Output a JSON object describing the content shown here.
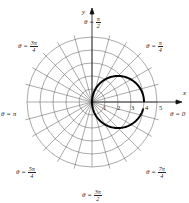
{
  "diagram": {
    "type": "polar-graph",
    "center": {
      "x": 92,
      "y": 102
    },
    "unit_px": 13,
    "rings": [
      1,
      2,
      3,
      4,
      5
    ],
    "radial_step_deg": 15,
    "axes": {
      "x_label": "x",
      "y_label": "y"
    },
    "r_tick_labels": [
      "1",
      "2",
      "3",
      "4",
      "5"
    ],
    "curve": {
      "description": "circle through origin, r = 4cos θ, with small gap just below the positive x-axis",
      "color": "#000000",
      "diameter": 4
    }
  },
  "angle_labels": [
    {
      "id": "pi_over_2",
      "prefix": "θ = ",
      "num": "π",
      "den": "2"
    },
    {
      "id": "pi_over_4",
      "prefix": "θ = ",
      "num": "π",
      "den": "4"
    },
    {
      "id": "three_pi_over_4",
      "prefix": "θ = ",
      "num": "3π",
      "den": "4"
    },
    {
      "id": "pi",
      "text": "θ = π"
    },
    {
      "id": "zero",
      "text": "θ = 0"
    },
    {
      "id": "five_pi_over_4",
      "prefix": "θ = ",
      "num": "5π",
      "den": "4"
    },
    {
      "id": "seven_pi_over_4",
      "prefix": "θ = ",
      "num": "7π",
      "den": "4"
    },
    {
      "id": "three_pi_over_2",
      "prefix": "θ = ",
      "num": "3π",
      "den": "2"
    }
  ]
}
